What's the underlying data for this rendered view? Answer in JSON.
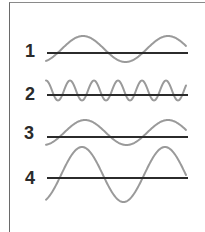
{
  "diagram": {
    "title": "",
    "colors": {
      "wave": "#9a9a9a",
      "axis": "#2b2b2b",
      "label": "#2a2a2a",
      "frame": "#6a6a6a"
    },
    "waves": [
      {
        "label": "1",
        "axis_y": 53,
        "center_y": 49,
        "amplitude": 13,
        "period": 85,
        "first_crest_x": 83,
        "x_start": 46,
        "x_end": 186
      },
      {
        "label": "2",
        "axis_y": 95,
        "center_y": 90.5,
        "amplitude": 10,
        "period": 24,
        "first_crest_x": 46,
        "x_start": 46,
        "x_end": 186
      },
      {
        "label": "3",
        "axis_y": 137,
        "center_y": 132.5,
        "amplitude": 12.5,
        "period": 83,
        "first_crest_x": 85,
        "x_start": 46,
        "x_end": 186
      },
      {
        "label": "4",
        "axis_y": 178,
        "center_y": 174.5,
        "amplitude": 27.5,
        "period": 83,
        "first_crest_x": 82,
        "x_start": 46,
        "x_end": 186
      }
    ],
    "axis_x_start": 47,
    "axis_x_end": 188
  }
}
